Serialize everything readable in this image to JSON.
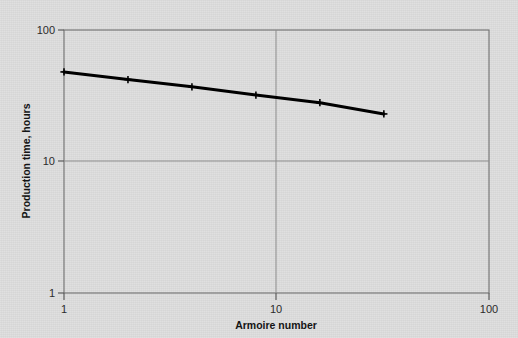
{
  "figure": {
    "background_color": "#dadada",
    "line_color": "#000000",
    "axis_color": "#6b6b6b",
    "grid_color": "#8a8a8a"
  },
  "chart_data": {
    "type": "line",
    "title": "",
    "xlabel": "Armoire number",
    "ylabel": "Production time, hours",
    "xscale": "log",
    "yscale": "log",
    "xlim": [
      1,
      100
    ],
    "ylim": [
      1,
      100
    ],
    "grid": true,
    "legend": null,
    "x": [
      1,
      2,
      4,
      8,
      16,
      32
    ],
    "values": [
      48,
      42,
      37,
      32,
      28,
      23
    ],
    "series": [
      {
        "name": "Production time",
        "x": [
          1,
          2,
          4,
          8,
          16,
          32
        ],
        "values": [
          48,
          42,
          37,
          32,
          28,
          23
        ],
        "marker": "plus",
        "line_width": 3
      }
    ],
    "xticks": [
      1,
      10,
      100
    ],
    "xtick_labels": [
      "1",
      "10",
      "100"
    ],
    "yticks": [
      1,
      10,
      100
    ],
    "ytick_labels": [
      "1",
      "10",
      "100"
    ]
  },
  "axes": {
    "y_top_label": "100",
    "y_mid_label": "10",
    "y_bottom_label": "1",
    "x_left_label": "1",
    "x_mid_label": "10",
    "x_right_label": "100",
    "x_axis_title": "Armoire number",
    "y_axis_title": "Production time, hours"
  }
}
